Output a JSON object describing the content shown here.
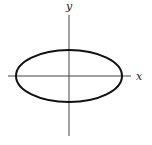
{
  "diagram": {
    "type": "ellipse-on-axes",
    "x_axis_label": "x",
    "y_axis_label": "y",
    "ellipse": {
      "cx": 69,
      "cy": 76,
      "rx": 53,
      "ry": 26
    },
    "x_axis": {
      "x1": 8,
      "x2": 131,
      "y": 76
    },
    "y_axis": {
      "x": 69,
      "y1": 15,
      "y2": 136
    },
    "colors": {
      "axis": "#444444",
      "curve": "#111111"
    }
  }
}
